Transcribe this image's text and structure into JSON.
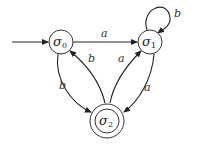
{
  "diagram": {
    "type": "finite-state-automaton",
    "states": [
      {
        "id": "s0",
        "symbol": "σ",
        "subscript": "0",
        "start": true,
        "accepting": false
      },
      {
        "id": "s1",
        "symbol": "σ",
        "subscript": "1",
        "start": false,
        "accepting": false
      },
      {
        "id": "s2",
        "symbol": "σ",
        "subscript": "2",
        "start": false,
        "accepting": true
      }
    ],
    "transitions": [
      {
        "from": "s0",
        "to": "s1",
        "label": "a"
      },
      {
        "from": "s1",
        "to": "s1",
        "label": "b"
      },
      {
        "from": "s0",
        "to": "s2",
        "label": "b"
      },
      {
        "from": "s2",
        "to": "s0",
        "label": "b"
      },
      {
        "from": "s2",
        "to": "s1",
        "label": "a"
      },
      {
        "from": "s1",
        "to": "s2",
        "label": "a"
      }
    ],
    "colors": {
      "stroke": "#222222",
      "background": "#ffffff"
    }
  }
}
